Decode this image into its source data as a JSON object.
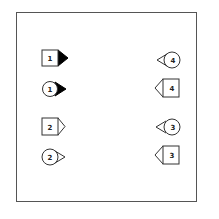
{
  "figure": {
    "left_column": [
      {
        "shape": "square",
        "label": "1",
        "pointer": "right",
        "pointer_fill": "filled"
      },
      {
        "shape": "circle",
        "label": "1",
        "pointer": "right",
        "pointer_fill": "filled"
      },
      {
        "shape": "square",
        "label": "2",
        "pointer": "right",
        "pointer_fill": "outline"
      },
      {
        "shape": "circle",
        "label": "2",
        "pointer": "right",
        "pointer_fill": "outline"
      }
    ],
    "right_column": [
      {
        "shape": "circle",
        "label": "4",
        "pointer": "left",
        "pointer_fill": "outline"
      },
      {
        "shape": "square",
        "label": "4",
        "pointer": "left",
        "pointer_fill": "outline"
      },
      {
        "shape": "circle",
        "label": "3",
        "pointer": "left",
        "pointer_fill": "outline"
      },
      {
        "shape": "square",
        "label": "3",
        "pointer": "left",
        "pointer_fill": "outline"
      }
    ],
    "colors": {
      "stroke": "#333333",
      "fill": "#ffffff",
      "filled_pointer": "#000000"
    }
  }
}
